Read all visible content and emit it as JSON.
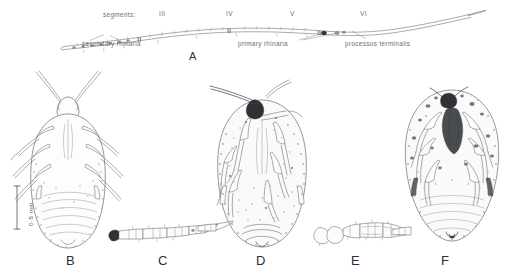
{
  "plate": {
    "title": "Aphid morphology plate",
    "background_color": "#ffffff",
    "ink_color": "#6e7276",
    "label_color": "#6a6e72"
  },
  "figure_a": {
    "letter": "A",
    "segments_label": "segments:",
    "segment_numerals": [
      "III",
      "IV",
      "V",
      "VI"
    ],
    "annotations": [
      {
        "text": "secondary rhinaria"
      },
      {
        "text": "primary rhinaria"
      },
      {
        "text": "processus terminalis"
      }
    ]
  },
  "figure_b": {
    "letter": "B",
    "scale_bar": "0·5 mm"
  },
  "figure_c": {
    "letter": "C"
  },
  "figure_d": {
    "letter": "D"
  },
  "figure_e": {
    "letter": "E"
  },
  "figure_f": {
    "letter": "F"
  }
}
